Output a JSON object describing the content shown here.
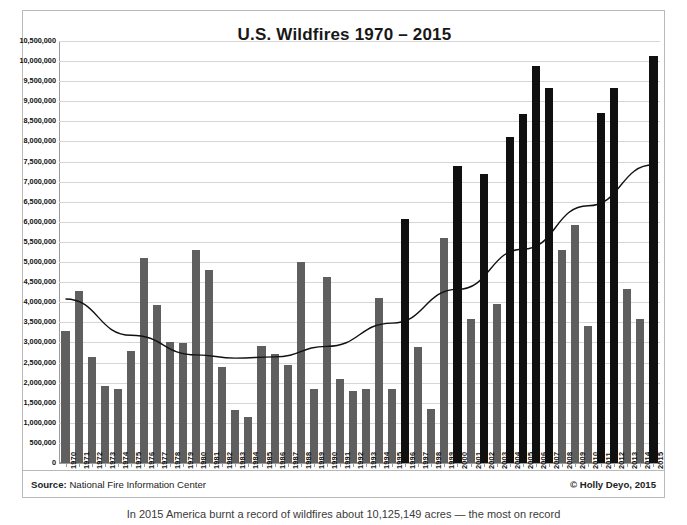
{
  "chart_data": {
    "type": "bar",
    "title": "U.S. Wildfires 1970 – 2015",
    "xlabel": "",
    "ylabel": "Acres Burned",
    "ylim": [
      0,
      10500000
    ],
    "ytick_step": 500000,
    "grid": true,
    "legend": null,
    "bar_colors": {
      "normal": "#5f5f5f",
      "highlight": "#101010"
    },
    "highlight_note": "Darker/black bars mark record-setting fire years",
    "yticks": [
      "10,500,000",
      "10,000,000",
      "9,500,000",
      "9,000,000",
      "8,500,000",
      "8,000,000",
      "7,500,000",
      "7,000,000",
      "6,500,000",
      "6,000,000",
      "5,500,000",
      "5,000,000",
      "4,500,000",
      "4,000,000",
      "3,500,000",
      "3,000,000",
      "2,500,000",
      "2,000,000",
      "1,500,000",
      "1,000,000",
      "500,000",
      "0"
    ],
    "categories": [
      "1970",
      "1971",
      "1972",
      "1973",
      "1974",
      "1975",
      "1976",
      "1977",
      "1978",
      "1979",
      "1980",
      "1981",
      "1982",
      "1983",
      "1984",
      "1985",
      "1986",
      "1987",
      "1988",
      "1989",
      "1990",
      "1991",
      "1992",
      "1993",
      "1994",
      "1995",
      "1996",
      "1997",
      "1998",
      "1999",
      "2000",
      "2001",
      "2002",
      "2003",
      "2004",
      "2005",
      "2006",
      "2007",
      "2008",
      "2009",
      "2010",
      "2011",
      "2012",
      "2013",
      "2014",
      "2015"
    ],
    "values": [
      3280000,
      4280000,
      2640000,
      1920000,
      1850000,
      2780000,
      5110000,
      3930000,
      3000000,
      2990000,
      5290000,
      4810000,
      2380000,
      1320000,
      1150000,
      2900000,
      2720000,
      2450000,
      5010000,
      1830000,
      4620000,
      2100000,
      1800000,
      1850000,
      4100000,
      1850000,
      6080000,
      2880000,
      1350000,
      5600000,
      7390000,
      3580000,
      7180000,
      3950000,
      8100000,
      8680000,
      9870000,
      9320000,
      5290000,
      5920000,
      3420000,
      8710000,
      9320000,
      4320000,
      3580000,
      10120000
    ],
    "highlight_years": [
      "1996",
      "2000",
      "2002",
      "2004",
      "2005",
      "2006",
      "2007",
      "2011",
      "2012",
      "2015"
    ],
    "trendline": {
      "present": true,
      "style": "polynomial (U-shaped, rising)",
      "color": "#111111",
      "points": [
        {
          "x": "1970",
          "y": 4080000
        },
        {
          "x": "1975",
          "y": 3180000
        },
        {
          "x": "1980",
          "y": 2690000
        },
        {
          "x": "1983",
          "y": 2610000
        },
        {
          "x": "1986",
          "y": 2640000
        },
        {
          "x": "1990",
          "y": 2900000
        },
        {
          "x": "1995",
          "y": 3480000
        },
        {
          "x": "2000",
          "y": 4320000
        },
        {
          "x": "2005",
          "y": 5320000
        },
        {
          "x": "2010",
          "y": 6400000
        },
        {
          "x": "2015",
          "y": 7420000
        }
      ]
    }
  },
  "footer": {
    "source_label": "Source:",
    "source_value": "National Fire Information Center",
    "copyright": "© Holly Deyo, 2015"
  },
  "below_caption": "In 2015 America burnt a record of wildfires about 10,125,149 acres — the most on record"
}
